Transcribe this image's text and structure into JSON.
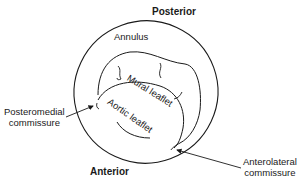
{
  "diagram": {
    "labels": {
      "posterior": "Posterior",
      "anterior": "Anterior",
      "annulus": "Annulus",
      "mural_leaflet": "Mural leaflet",
      "aortic_leaflet": "Aortic leaflet",
      "posteromedial_line1": "Posteromedial",
      "posteromedial_line2": "commissure",
      "anterolateral_line1": "Anterolateral",
      "anterolateral_line2": "commissure"
    },
    "colors": {
      "stroke": "#1a1a1a",
      "background": "#ffffff"
    }
  }
}
